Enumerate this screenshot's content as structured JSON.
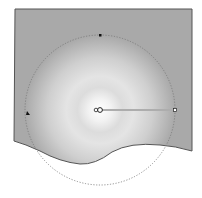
{
  "canvas": {
    "background": "#ffffff",
    "shape": {
      "fill_outer": "#a9a9a9",
      "fill_inner": "#ffffff",
      "stroke": "#555555"
    },
    "gradient_tool": {
      "type": "radial",
      "center": [
        100,
        110
      ],
      "radius": 75,
      "circle_stroke": "#777777",
      "handle_end": [
        175,
        110
      ],
      "handle_top": [
        100,
        35
      ],
      "handle_left": [
        27,
        113
      ]
    }
  }
}
